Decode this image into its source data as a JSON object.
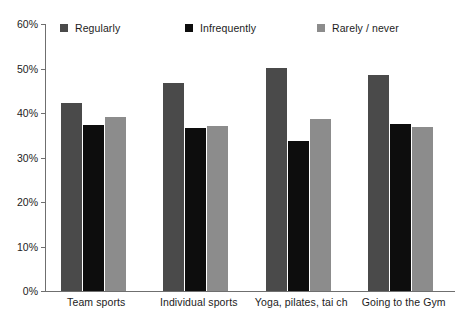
{
  "chart_data": {
    "type": "bar",
    "title": "",
    "subtitle": "",
    "xlabel": "",
    "ylabel": "",
    "categories": [
      "Team sports",
      "Individual sports",
      "Yoga, pilates, tai ch",
      "Going to the Gym"
    ],
    "series": [
      {
        "name": "Regularly",
        "color": "#4a4a4a",
        "values": [
          42.3,
          46.8,
          50.1,
          48.6
        ]
      },
      {
        "name": "Infrequently",
        "color": "#0d0d0d",
        "values": [
          37.4,
          36.6,
          33.6,
          37.5
        ]
      },
      {
        "name": "Rarely / never",
        "color": "#8c8c8c",
        "values": [
          39.1,
          37.0,
          38.7,
          36.9
        ]
      }
    ],
    "ylim": [
      0,
      60
    ],
    "ytick_values": [
      0,
      10,
      20,
      30,
      40,
      50,
      60
    ],
    "ytick_labels": [
      "0%",
      "10%",
      "20%",
      "30%",
      "40%",
      "50%",
      "60%"
    ],
    "value_suffix": "%",
    "grid": false,
    "legend_position": "top",
    "axis_color": "#6f6f6f",
    "background": "#ffffff"
  }
}
